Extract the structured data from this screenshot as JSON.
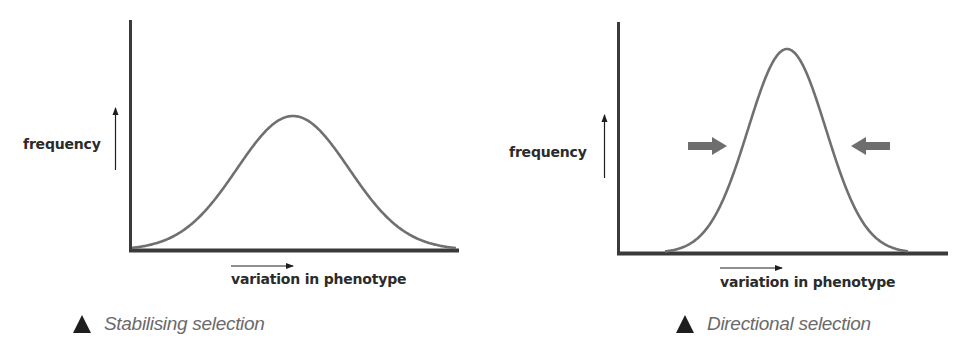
{
  "figure": {
    "colors": {
      "axis": "#3a3a3a",
      "curve": "#707070",
      "pressure_arrow": "#6e6e6e",
      "label_text": "#2b2b2b",
      "caption_text": "#6a6a6a",
      "triangle_marker": "#1e1e1e"
    },
    "panels": [
      {
        "id": "left",
        "y_label": "frequency",
        "x_label": "variation in phenotype",
        "caption": "Stabilising selection",
        "marker_icon": "triangle-up",
        "has_pressure_arrows": false
      },
      {
        "id": "right",
        "y_label": "frequency",
        "x_label": "variation in phenotype",
        "caption": "Directional selection",
        "marker_icon": "triangle-up",
        "has_pressure_arrows": true,
        "pressure_arrows": [
          "right-pointing-arrow",
          "left-pointing-arrow"
        ]
      }
    ]
  },
  "chart_data": [
    {
      "type": "line",
      "title": "Stabilising selection",
      "xlabel": "variation in phenotype",
      "ylabel": "frequency",
      "grid": false,
      "description": "Broad bell-shaped (normal) distribution curve centred in the phenotype range",
      "series": [
        {
          "name": "distribution",
          "shape": "normal",
          "mean_relative": 0.5,
          "spread": "wide",
          "peak_relative_height": 0.59
        }
      ]
    },
    {
      "type": "line",
      "title": "Directional selection",
      "xlabel": "variation in phenotype",
      "ylabel": "frequency",
      "grid": false,
      "description": "Narrow, taller bell-shaped curve with two grey arrows pointing inward from both sides toward the centre",
      "series": [
        {
          "name": "distribution",
          "shape": "normal",
          "mean_relative": 0.5,
          "spread": "narrow",
          "peak_relative_height": 0.88
        }
      ],
      "annotations": [
        "inward arrow from left",
        "inward arrow from right"
      ]
    }
  ]
}
